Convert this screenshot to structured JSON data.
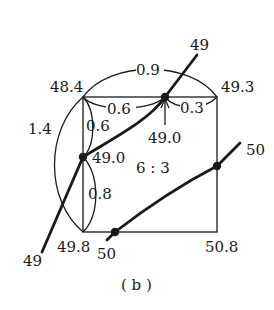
{
  "figure": {
    "caption": "( b )",
    "ratio_label": "6 : 3"
  },
  "corners": {
    "top_left": "48.4",
    "top_right": "49.3",
    "bottom_left": "49.8",
    "bottom_right": "50.8"
  },
  "interpolated_points": {
    "top_edge_point": "49.0",
    "left_edge_point": "49.0"
  },
  "distances": {
    "top_arc": "0.9",
    "top_left_segment": "0.6",
    "top_right_segment": "0.3",
    "left_arc": "1.4",
    "left_upper_segment": "0.6",
    "left_lower_segment": "0.8"
  },
  "contours": [
    {
      "label_start": "49",
      "label_end": "49",
      "value": 49
    },
    {
      "label_start": "50",
      "label_end": "50",
      "value": 50
    }
  ]
}
